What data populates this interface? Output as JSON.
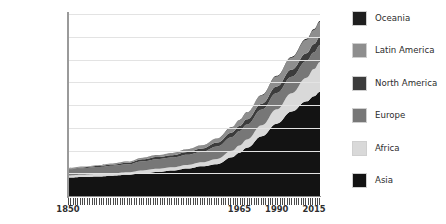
{
  "chart_data": {
    "type": "area",
    "stacked": true,
    "title": "",
    "subtitle": "",
    "xlabel": "",
    "ylabel": "",
    "xlim": [
      1850,
      2019
    ],
    "ylim": [
      0,
      8000000000
    ],
    "grid": true,
    "legend_position": "right",
    "y_tick_labels": [
      "8,000,000,000",
      "7,000,000,000",
      "6,000,000,000",
      "5,000,000,000",
      "4,000,000,000",
      "3,000,000,000",
      "2,000,000,000",
      "1,000,000,000",
      "0"
    ],
    "y_tick_values": [
      8000000000,
      7000000000,
      6000000000,
      5000000000,
      4000000000,
      3000000000,
      2000000000,
      1000000000,
      0
    ],
    "x_tick_labels": [
      "1850",
      "1965",
      "1990",
      "2015"
    ],
    "x_tick_values": [
      1850,
      1965,
      1990,
      2015
    ],
    "x": [
      1850,
      1860,
      1870,
      1880,
      1890,
      1900,
      1910,
      1920,
      1930,
      1940,
      1950,
      1960,
      1965,
      1970,
      1980,
      1990,
      2000,
      2010,
      2015,
      2019
    ],
    "stack_order_bottom_to_top": [
      "Asia",
      "Africa",
      "Europe",
      "North America",
      "Latin America",
      "Oceania"
    ],
    "series": [
      {
        "name": "Asia",
        "color": "#131313",
        "values": [
          809000000,
          835000000,
          862000000,
          895000000,
          930000000,
          1000000000,
          1060000000,
          1120000000,
          1210000000,
          1310000000,
          1400000000,
          1700000000,
          1900000000,
          2120000000,
          2630000000,
          3180000000,
          3710000000,
          4160000000,
          4390000000,
          4580000000
        ]
      },
      {
        "name": "Africa",
        "color": "#d9d9d9",
        "values": [
          90000000,
          95000000,
          100000000,
          106000000,
          112000000,
          124000000,
          133000000,
          141000000,
          155000000,
          172000000,
          228000000,
          285000000,
          320000000,
          366000000,
          481000000,
          630000000,
          810000000,
          1040000000,
          1190000000,
          1310000000
        ]
      },
      {
        "name": "Europe",
        "color": "#777777",
        "values": [
          276000000,
          295000000,
          312000000,
          330000000,
          352000000,
          408000000,
          427000000,
          428000000,
          446000000,
          465000000,
          549000000,
          605000000,
          634000000,
          656000000,
          694000000,
          721000000,
          727000000,
          736000000,
          740000000,
          747000000
        ]
      },
      {
        "name": "North America",
        "color": "#3c3c3c",
        "values": [
          26000000,
          32000000,
          40000000,
          50000000,
          63000000,
          82000000,
          94000000,
          107000000,
          126000000,
          141000000,
          172000000,
          204000000,
          219000000,
          231000000,
          254000000,
          280000000,
          313000000,
          343000000,
          357000000,
          367000000
        ]
      },
      {
        "name": "Latin America",
        "color": "#8e8e8e",
        "values": [
          33000000,
          37000000,
          40000000,
          45000000,
          51000000,
          65000000,
          78000000,
          91000000,
          109000000,
          131000000,
          169000000,
          221000000,
          252000000,
          287000000,
          362000000,
          443000000,
          522000000,
          591000000,
          625000000,
          648000000
        ]
      },
      {
        "name": "Oceania",
        "color": "#1f1f1f",
        "values": [
          2000000,
          2500000,
          3000000,
          4000000,
          5000000,
          6000000,
          7000000,
          8600000,
          10000000,
          11000000,
          13000000,
          16000000,
          18000000,
          20000000,
          23000000,
          27000000,
          31000000,
          37000000,
          40000000,
          42000000
        ]
      }
    ],
    "legend_entries": [
      {
        "label": "Oceania",
        "color": "#1f1f1f"
      },
      {
        "label": "Latin America",
        "color": "#8e8e8e"
      },
      {
        "label": "North America",
        "color": "#3c3c3c"
      },
      {
        "label": "Europe",
        "color": "#777777"
      },
      {
        "label": "Africa",
        "color": "#d9d9d9"
      },
      {
        "label": "Asia",
        "color": "#131313"
      }
    ]
  },
  "colors": {
    "background": "#ffffff",
    "gridline": "#e3e3e3",
    "axis": "#909090",
    "tick_text": "#2e2e2e"
  }
}
